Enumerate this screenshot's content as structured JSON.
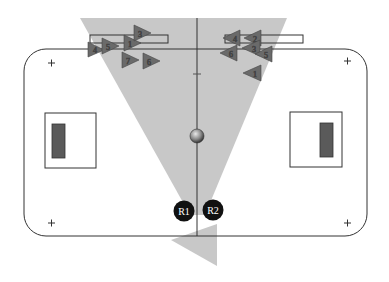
{
  "diagram": {
    "type": "robot-soccer-field",
    "colors": {
      "background": "#ffffff",
      "field_line": "#333333",
      "view_cone": "#c8c8c8",
      "goal_fill": "#5a5a5a",
      "marker": "#6a6a6a",
      "robot": "#111111",
      "robot_text": "#ffffff",
      "ball": "#777777"
    },
    "robots": [
      {
        "id": "R1",
        "label": "R1",
        "x": 184,
        "y": 211
      },
      {
        "id": "R2",
        "label": "R2",
        "x": 213,
        "y": 210
      }
    ],
    "ball": {
      "x": 197,
      "y": 136
    },
    "corner_marks": [
      "+",
      "+",
      "+",
      "+"
    ],
    "left_markers": [
      {
        "label": "1",
        "x": 131,
        "y": 43
      },
      {
        "label": "3",
        "x": 141,
        "y": 33
      },
      {
        "label": "4",
        "x": 96,
        "y": 50
      },
      {
        "label": "5",
        "x": 110,
        "y": 46
      },
      {
        "label": "7",
        "x": 130,
        "y": 60
      },
      {
        "label": "6",
        "x": 150,
        "y": 61
      }
    ],
    "right_markers": [
      {
        "label": "4",
        "x": 233,
        "y": 38
      },
      {
        "label": "2",
        "x": 254,
        "y": 38
      },
      {
        "label": "3",
        "x": 252,
        "y": 48
      },
      {
        "label": "6",
        "x": 229,
        "y": 53
      },
      {
        "label": "5",
        "x": 264,
        "y": 54
      },
      {
        "label": "1",
        "x": 254,
        "y": 73
      }
    ]
  }
}
